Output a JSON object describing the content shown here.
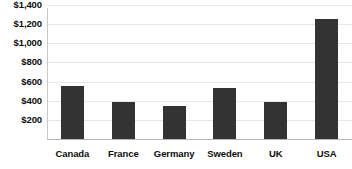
{
  "chart_data": {
    "type": "bar",
    "title": "",
    "subtitle": "",
    "xlabel": "",
    "ylabel": "",
    "categories": [
      "Canada",
      "France",
      "Germany",
      "Sweden",
      "UK",
      "USA"
    ],
    "values": [
      550,
      390,
      340,
      530,
      390,
      1250
    ],
    "ylim": [
      0,
      1450
    ],
    "yticks": [
      200,
      400,
      600,
      800,
      1000,
      1200,
      1400
    ],
    "ytick_labels": [
      "$200",
      "$400",
      "$600",
      "$800",
      "$1,000",
      "$1,200",
      "$1,400"
    ],
    "grid": true,
    "legend": false,
    "bar_color": "#333333",
    "grid_color": "#e6e6e6",
    "axis_color": "#b5b5b5",
    "background_color": "#ffffff",
    "text_color": "#0d0d0d"
  }
}
